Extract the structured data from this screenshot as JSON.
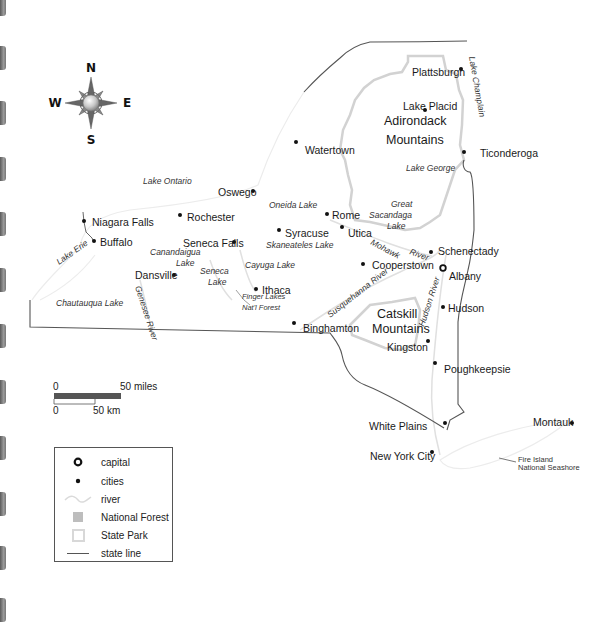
{
  "map": {
    "compass": {
      "n": "N",
      "s": "S",
      "e": "E",
      "w": "W"
    },
    "cities": [
      {
        "name": "Plattsburgh",
        "x": 461,
        "y": 69,
        "lx": 412,
        "ly": 72
      },
      {
        "name": "Lake Placid",
        "x": 425,
        "y": 110,
        "lx": 403,
        "ly": 106
      },
      {
        "name": "Ticonderoga",
        "x": 464,
        "y": 152,
        "lx": 480,
        "ly": 153
      },
      {
        "name": "Watertown",
        "x": 296,
        "y": 142,
        "lx": 305,
        "ly": 150
      },
      {
        "name": "Oswego",
        "x": 253,
        "y": 191,
        "lx": 218,
        "ly": 192
      },
      {
        "name": "Rochester",
        "x": 180,
        "y": 215,
        "lx": 187,
        "ly": 217
      },
      {
        "name": "Niagara Falls",
        "x": 84,
        "y": 221,
        "lx": 92,
        "ly": 222
      },
      {
        "name": "Buffalo",
        "x": 94,
        "y": 241,
        "lx": 100,
        "ly": 242
      },
      {
        "name": "Rome",
        "x": 327,
        "y": 214,
        "lx": 332,
        "ly": 215
      },
      {
        "name": "Syracuse",
        "x": 279,
        "y": 230,
        "lx": 285,
        "ly": 233
      },
      {
        "name": "Utica",
        "x": 342,
        "y": 227,
        "lx": 348,
        "ly": 233
      },
      {
        "name": "Seneca Falls",
        "x": 234,
        "y": 242,
        "lx": 183,
        "ly": 243
      },
      {
        "name": "Cooperstown",
        "x": 363,
        "y": 264,
        "lx": 372,
        "ly": 265
      },
      {
        "name": "Schenectady",
        "x": 431,
        "y": 252,
        "lx": 438,
        "ly": 251
      },
      {
        "name": "Dansville",
        "x": 174,
        "y": 275,
        "lx": 135,
        "ly": 275
      },
      {
        "name": "Ithaca",
        "x": 256,
        "y": 289,
        "lx": 262,
        "ly": 290
      },
      {
        "name": "Binghamton",
        "x": 294,
        "y": 323,
        "lx": 303,
        "ly": 328
      },
      {
        "name": "Hudson",
        "x": 443,
        "y": 307,
        "lx": 448,
        "ly": 308
      },
      {
        "name": "Kingston",
        "x": 428,
        "y": 341,
        "lx": 387,
        "ly": 347
      },
      {
        "name": "Poughkeepsie",
        "x": 435,
        "y": 363,
        "lx": 444,
        "ly": 369
      },
      {
        "name": "White Plains",
        "x": 445,
        "y": 423,
        "lx": 369,
        "ly": 426
      },
      {
        "name": "New York City",
        "x": 432,
        "y": 452,
        "lx": 370,
        "ly": 456
      },
      {
        "name": "Montauk",
        "x": 572,
        "y": 423,
        "lx": 533,
        "ly": 422
      }
    ],
    "capital": {
      "name": "Albany",
      "x": 443,
      "y": 268,
      "lx": 449,
      "ly": 276
    },
    "regions": [
      {
        "name": "Adirondack",
        "x": 384,
        "y": 125
      },
      {
        "name": "Mountains",
        "x": 386,
        "y": 144
      },
      {
        "name": "Catskill",
        "x": 377,
        "y": 318
      },
      {
        "name": "Mountains",
        "x": 372,
        "y": 333
      }
    ],
    "water": [
      {
        "name": "Lake Ontario",
        "x": 143,
        "y": 184,
        "rot": 0
      },
      {
        "name": "Lake George",
        "x": 406,
        "y": 171,
        "rot": 0
      },
      {
        "name": "Oneida Lake",
        "x": 269,
        "y": 208,
        "rot": 0
      },
      {
        "name": "Great",
        "x": 391,
        "y": 207,
        "rot": 0
      },
      {
        "name": "Sacandaga",
        "x": 369,
        "y": 218,
        "rot": 0
      },
      {
        "name": "Lake",
        "x": 387,
        "y": 229,
        "rot": 0
      },
      {
        "name": "Skaneateles Lake",
        "x": 266,
        "y": 248,
        "rot": 0
      },
      {
        "name": "Canandaigua",
        "x": 150,
        "y": 255,
        "rot": 0
      },
      {
        "name": "Lake",
        "x": 176,
        "y": 266,
        "rot": 0
      },
      {
        "name": "Cayuga Lake",
        "x": 245,
        "y": 268,
        "rot": 0
      },
      {
        "name": "Seneca",
        "x": 200,
        "y": 274,
        "rot": 0
      },
      {
        "name": "Lake",
        "x": 208,
        "y": 285,
        "rot": 0
      },
      {
        "name": "Lake Erie",
        "x": 59,
        "y": 265,
        "rot": -35
      },
      {
        "name": "Chautauqua Lake",
        "x": 56,
        "y": 306,
        "rot": 0
      },
      {
        "name": "Mohawk",
        "x": 370,
        "y": 244,
        "rot": 28
      },
      {
        "name": "River",
        "x": 409,
        "y": 254,
        "rot": 20
      },
      {
        "name": "Susquehanna River",
        "x": 330,
        "y": 318,
        "rot": -38
      },
      {
        "name": "Genesee River",
        "x": 135,
        "y": 287,
        "rot": 72
      },
      {
        "name": "Hudson River",
        "x": 424,
        "y": 327,
        "rot": -72
      },
      {
        "name": "Lake Champlain",
        "x": 469,
        "y": 57,
        "rot": 80
      }
    ],
    "forest_label": {
      "line1": "Finger Lakes",
      "line2": "Nat'l Forest"
    },
    "seashore_label": {
      "line1": "Fire Island",
      "line2": "National Seashore"
    }
  },
  "scale": {
    "miles_start": "0",
    "miles_end": "50 miles",
    "km_start": "0",
    "km_end": "50 km"
  },
  "legend": {
    "items": [
      {
        "symbol": "capital-icon",
        "label": "capital"
      },
      {
        "symbol": "city-dot-icon",
        "label": "cities"
      },
      {
        "symbol": "river-icon",
        "label": "river"
      },
      {
        "symbol": "national-forest-swatch",
        "label": "National Forest"
      },
      {
        "symbol": "state-park-swatch",
        "label": "State Park"
      },
      {
        "symbol": "state-line-icon",
        "label": "state line"
      }
    ]
  },
  "colors": {
    "state_line": "#555555",
    "park_boundary": "#cfcfcf",
    "river": "#e2e2e2",
    "forest": "#bdbdbd",
    "city_dot": "#111111"
  }
}
